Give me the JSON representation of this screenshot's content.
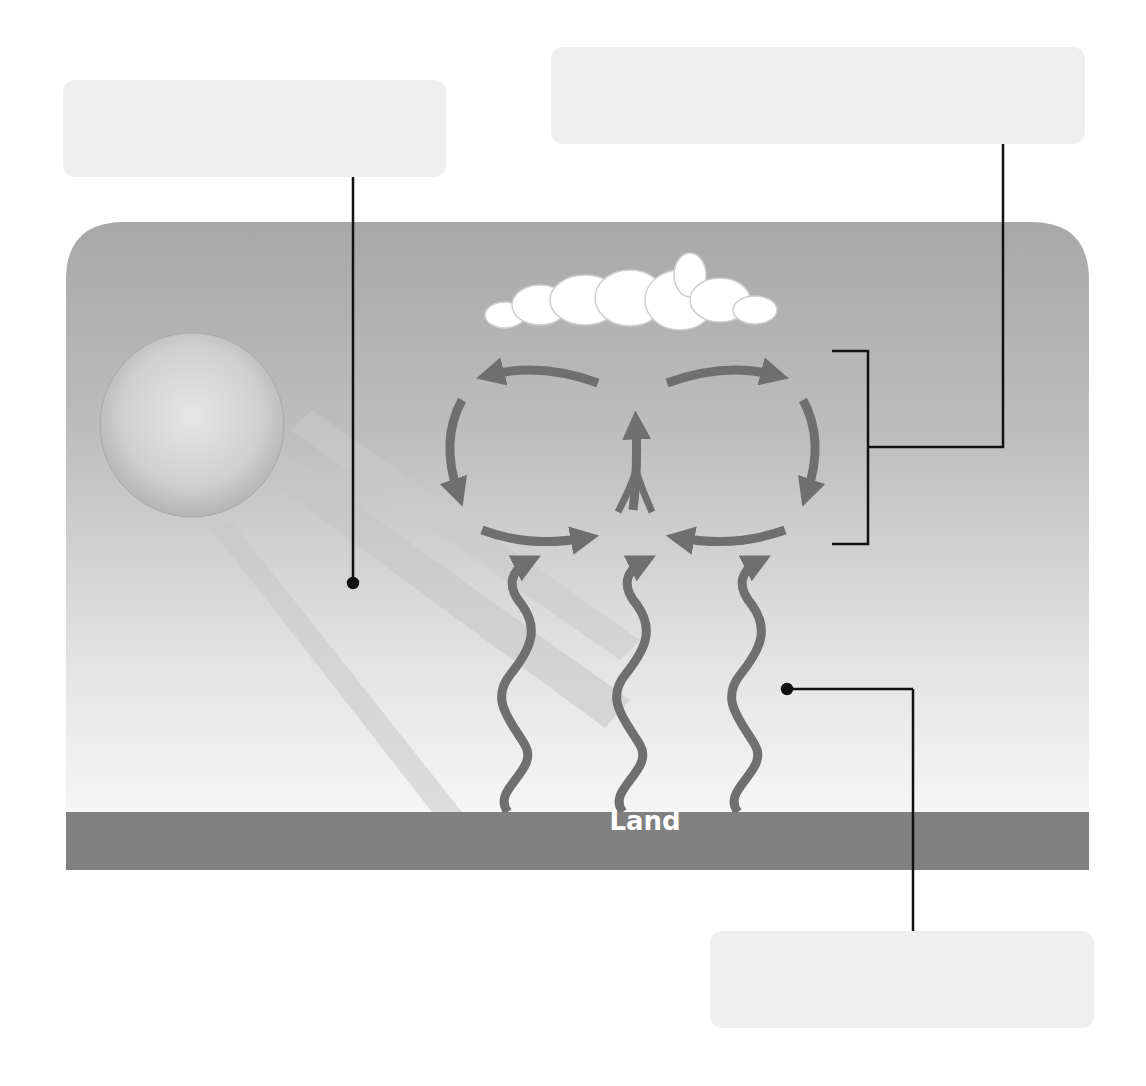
{
  "diagram": {
    "type": "convection_diagram",
    "colors": {
      "sky_top": "#a9a9a9",
      "sky_bottom": "#f4f4f4",
      "land": "#808080",
      "arrow": "#707070",
      "label_box": "#efefef",
      "leader_line": "#111111",
      "cloud": "#ffffff",
      "sun": "#d6d6d6"
    },
    "ground": {
      "label": "Land"
    },
    "labels": [
      {
        "id": "label-radiation",
        "text": "",
        "position": "top-left",
        "points_to": "sun-rays"
      },
      {
        "id": "label-convection-cell",
        "text": "",
        "position": "top-right",
        "points_to": "convection-bracket"
      },
      {
        "id": "label-rising-heat",
        "text": "",
        "position": "bottom-right",
        "points_to": "heat-waves"
      }
    ],
    "elements": {
      "sun": "sun-icon",
      "rays": 3,
      "cloud": "cloud-icon",
      "convection_cells": 2,
      "rising_heat_arrows": 3
    }
  }
}
